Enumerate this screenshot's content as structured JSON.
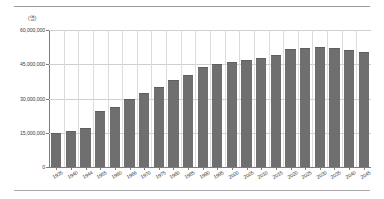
{
  "chart_data": {
    "type": "bar",
    "title": "",
    "subtitle": "",
    "unit_label": "(명)",
    "xlabel": "",
    "ylabel": "",
    "ylim": [
      0,
      60000000
    ],
    "grid": true,
    "legend": false,
    "legend_position": "none",
    "bar_color": "#6f6f6f",
    "categories": [
      "1935",
      "1940",
      "1944",
      "1955",
      "1960",
      "1966",
      "1970",
      "1975",
      "1980",
      "1985",
      "1990",
      "1995",
      "2000",
      "2005",
      "2010",
      "2015",
      "2020",
      "2025",
      "2030",
      "2035",
      "2040",
      "2045"
    ],
    "values": [
      15000000,
      15800000,
      17100000,
      24700000,
      26100000,
      29900000,
      32200000,
      35100000,
      38100000,
      40400000,
      43800000,
      45100000,
      46100000,
      46900000,
      47800000,
      49200000,
      51500000,
      52100000,
      52400000,
      52000000,
      51400000,
      50400000
    ],
    "y_ticks": [
      {
        "value": 0,
        "label": "0"
      },
      {
        "value": 15000000,
        "label": "15,000,000"
      },
      {
        "value": 30000000,
        "label": "30,000,000"
      },
      {
        "value": 45000000,
        "label": "45,000,000"
      },
      {
        "value": 60000000,
        "label": "60,000,000"
      }
    ],
    "annotations": []
  }
}
